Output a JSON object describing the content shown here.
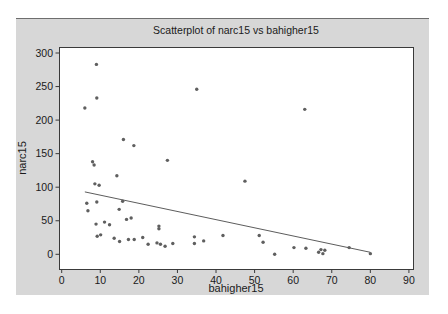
{
  "chart_data": {
    "type": "scatter",
    "title": "Scatterplot of narc15 vs bahigher15",
    "xlabel": "bahigher15",
    "ylabel": "narc15",
    "xlim": [
      0,
      90
    ],
    "ylim": [
      0,
      300
    ],
    "x_ticks": [
      0,
      10,
      20,
      30,
      40,
      50,
      60,
      70,
      80,
      90
    ],
    "y_ticks": [
      0,
      50,
      100,
      150,
      200,
      250,
      300
    ],
    "grid": false,
    "legend": "none",
    "points": [
      [
        9,
        283
      ],
      [
        35,
        246
      ],
      [
        9.1,
        233
      ],
      [
        6,
        218
      ],
      [
        63,
        216
      ],
      [
        16,
        171
      ],
      [
        18.7,
        162
      ],
      [
        27.4,
        140
      ],
      [
        8,
        138
      ],
      [
        8.4,
        133
      ],
      [
        14.3,
        117
      ],
      [
        47.5,
        109
      ],
      [
        8.6,
        105
      ],
      [
        9.7,
        103
      ],
      [
        15.8,
        79
      ],
      [
        9.1,
        78
      ],
      [
        6.5,
        76
      ],
      [
        14.9,
        67
      ],
      [
        6.8,
        65
      ],
      [
        18,
        54
      ],
      [
        16.8,
        52
      ],
      [
        11.1,
        48
      ],
      [
        8.9,
        45
      ],
      [
        12.4,
        44
      ],
      [
        25.2,
        42
      ],
      [
        25.2,
        38
      ],
      [
        10.1,
        29
      ],
      [
        9.2,
        27
      ],
      [
        13.6,
        24
      ],
      [
        15,
        19
      ],
      [
        17.3,
        22
      ],
      [
        18.8,
        22
      ],
      [
        21,
        25
      ],
      [
        22.4,
        15
      ],
      [
        24.7,
        17
      ],
      [
        25.6,
        15
      ],
      [
        26.8,
        12
      ],
      [
        28.8,
        16
      ],
      [
        34.4,
        26
      ],
      [
        34.4,
        16
      ],
      [
        36.8,
        20
      ],
      [
        41.8,
        28
      ],
      [
        51.2,
        28
      ],
      [
        52.2,
        18
      ],
      [
        55.2,
        0
      ],
      [
        60.2,
        10
      ],
      [
        63.3,
        9
      ],
      [
        66.6,
        3
      ],
      [
        67.2,
        7
      ],
      [
        67.7,
        1
      ],
      [
        68.2,
        6
      ],
      [
        74.5,
        10
      ],
      [
        80,
        1
      ]
    ],
    "trend_line": {
      "x1": 6,
      "y1": 93,
      "x2": 80,
      "y2": 3
    },
    "colors": {
      "panel_bg": "#d7d7d7",
      "plot_bg": "#ffffff",
      "dot": "#5f5f5f",
      "trend": "#4a4a4a",
      "frame": "#3a3a3a",
      "text": "#1a1a1a"
    }
  }
}
